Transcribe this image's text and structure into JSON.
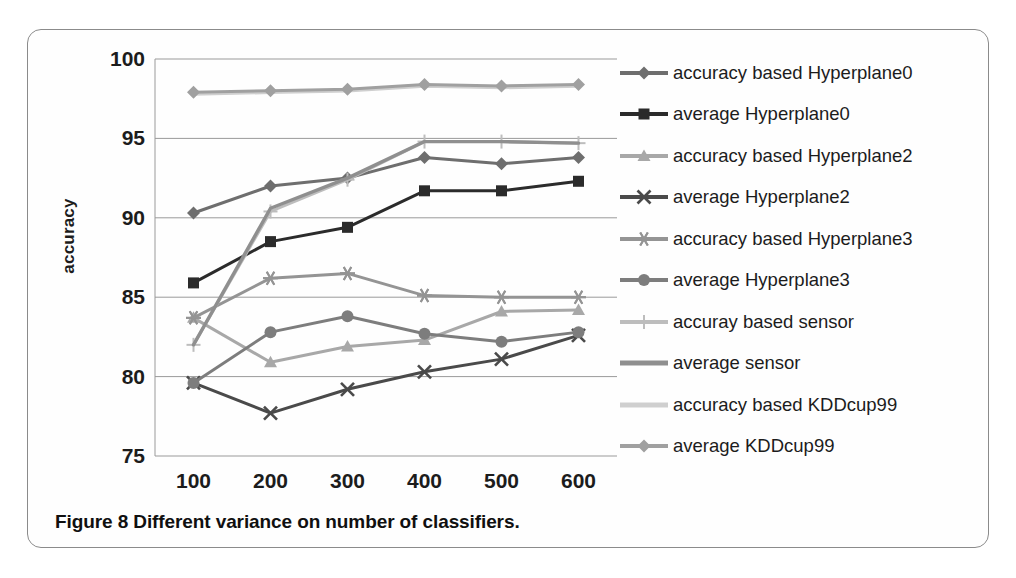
{
  "figure": {
    "caption": "Figure 8 Different variance on number of classifiers."
  },
  "chart_data": {
    "type": "line",
    "title": "",
    "xlabel": "",
    "ylabel": "accuracy",
    "x": [
      100,
      200,
      300,
      400,
      500,
      600
    ],
    "categories": [
      "100",
      "200",
      "300",
      "400",
      "500",
      "600"
    ],
    "xtick_labels": [
      "100",
      "200",
      "300",
      "400",
      "500",
      "600"
    ],
    "ytick_labels": [
      "75",
      "80",
      "85",
      "90",
      "95",
      "100"
    ],
    "ylim": [
      75,
      100
    ],
    "ytick_step": 5,
    "grid": "horizontal",
    "legend_position": "right",
    "series": [
      {
        "name": "accuracy based Hyperplane0",
        "marker": "diamond",
        "color": "#6e6e6e",
        "values": [
          90.3,
          92.0,
          92.5,
          93.8,
          93.4,
          93.8
        ]
      },
      {
        "name": "average Hyperplane0",
        "marker": "square",
        "color": "#2b2b2b",
        "values": [
          85.9,
          88.5,
          89.4,
          91.7,
          91.7,
          92.3
        ]
      },
      {
        "name": "accuracy based Hyperplane2",
        "marker": "triangle",
        "color": "#a8a8a8",
        "values": [
          83.7,
          80.9,
          81.9,
          82.3,
          84.1,
          84.2
        ]
      },
      {
        "name": "average Hyperplane2",
        "marker": "x",
        "color": "#4a4a4a",
        "values": [
          79.6,
          77.7,
          79.2,
          80.3,
          81.1,
          82.6
        ]
      },
      {
        "name": "accuracy based Hyperplane3",
        "marker": "asterisk",
        "color": "#949494",
        "values": [
          83.7,
          86.2,
          86.5,
          85.1,
          85.0,
          85.0
        ]
      },
      {
        "name": "average Hyperplane3",
        "marker": "circle",
        "color": "#7d7d7d",
        "values": [
          79.6,
          82.8,
          83.8,
          82.7,
          82.2,
          82.8
        ]
      },
      {
        "name": "accuray based sensor",
        "marker": "plus",
        "color": "#bdbdbd",
        "values": [
          82.0,
          90.4,
          92.4,
          94.8,
          94.8,
          94.7
        ]
      },
      {
        "name": "average sensor",
        "marker": "none",
        "color": "#8f8f8f",
        "values": [
          82.0,
          90.6,
          92.5,
          94.8,
          94.8,
          94.7
        ]
      },
      {
        "name": "accuracy based KDDcup99",
        "marker": "none",
        "color": "#cfcfcf",
        "values": [
          97.8,
          97.9,
          98.0,
          98.3,
          98.2,
          98.3
        ]
      },
      {
        "name": "average KDDcup99",
        "marker": "diamond",
        "color": "#a0a0a0",
        "values": [
          97.9,
          98.0,
          98.1,
          98.4,
          98.3,
          98.4
        ]
      }
    ]
  },
  "legend": {
    "items": [
      {
        "label": "accuracy based Hyperplane0",
        "icon": "diamond-marker-icon"
      },
      {
        "label": "average Hyperplane0",
        "icon": "square-marker-icon"
      },
      {
        "label": "accuracy based Hyperplane2",
        "icon": "triangle-marker-icon"
      },
      {
        "label": "average Hyperplane2",
        "icon": "x-marker-icon"
      },
      {
        "label": "accuracy based Hyperplane3",
        "icon": "asterisk-marker-icon"
      },
      {
        "label": "average Hyperplane3",
        "icon": "circle-marker-icon"
      },
      {
        "label": "accuray based sensor",
        "icon": "plus-marker-icon"
      },
      {
        "label": "average sensor",
        "icon": "line-marker-icon"
      },
      {
        "label": "accuracy based KDDcup99",
        "icon": "line-marker-icon"
      },
      {
        "label": "average KDDcup99",
        "icon": "diamond-marker-icon"
      }
    ]
  }
}
